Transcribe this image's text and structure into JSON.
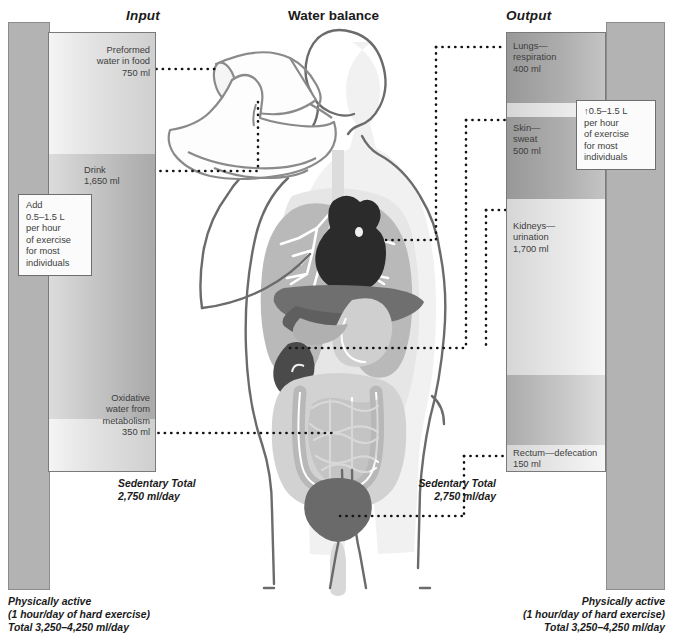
{
  "title": "Water balance",
  "columns": {
    "input_label": "Input",
    "output_label": "Output"
  },
  "input": {
    "segments": [
      {
        "name": "preformed-water",
        "label": "Preformed\nwater in food\n750 ml",
        "value_ml": 750
      },
      {
        "name": "drink",
        "label": "Drink\n1,650 ml",
        "value_ml": 1650
      },
      {
        "name": "oxidative-water",
        "label": "Oxidative\nwater from\nmetabolism\n350 ml",
        "value_ml": 350
      }
    ],
    "callout": "Add\n0.5–1.5 L\nper hour\nof exercise\nfor most\nindividuals",
    "sedentary_total": "Sedentary Total\n2,750 ml/day",
    "active_total": "Physically active\n(1 hour/day of hard exercise)\nTotal 3,250–4,250 ml/day"
  },
  "output": {
    "segments": [
      {
        "name": "lungs-respiration",
        "label": "Lungs—\nrespiration\n400 ml",
        "value_ml": 400
      },
      {
        "name": "skin-sweat",
        "label": "Skin—\nsweat\n500 ml",
        "value_ml": 500
      },
      {
        "name": "kidneys-urination",
        "label": "Kidneys—\nurination\n1,700 ml",
        "value_ml": 1700
      },
      {
        "name": "rectum-defecation",
        "label": "Rectum—defecation\n150 ml",
        "value_ml": 150
      }
    ],
    "callout": "↑0.5–1.5 L\nper hour\nof exercise\nfor most\nindividuals",
    "sedentary_total": "Sedentary Total\n2,750 ml/day",
    "active_total": "Physically active\n(1 hour/day of hard exercise)\nTotal 3,250–4,250 ml/day"
  },
  "figure": {
    "name": "human-body-water-balance-illustration",
    "organs": [
      "lungs",
      "heart",
      "liver",
      "stomach",
      "kidney",
      "small-intestine",
      "large-intestine",
      "bladder",
      "drinking-glass",
      "hand",
      "head"
    ]
  },
  "colors": {
    "bar_active": "#b3b3b3",
    "bar_outline": "#7a7a7a",
    "dotted_line": "#141414",
    "text": "#231f20",
    "organ_light": "#d8d8d8",
    "organ_mid": "#9a9a9a",
    "organ_dark": "#4a4a4a",
    "organ_darkest": "#2b2b2b"
  }
}
